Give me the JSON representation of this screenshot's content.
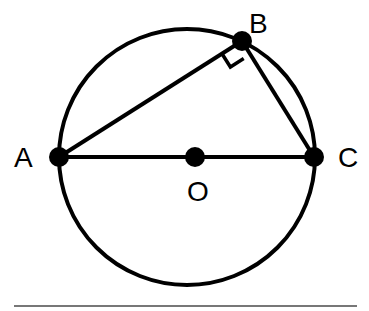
{
  "diagram": {
    "points": {
      "A": {
        "label": "A"
      },
      "B": {
        "label": "B"
      },
      "C": {
        "label": "C"
      },
      "O": {
        "label": "O"
      }
    },
    "segments": [
      "AB",
      "BC",
      "AC"
    ],
    "right_angle_at": "B",
    "center": "O",
    "colors": {
      "stroke": "#000000",
      "rule": "#777777",
      "background": "#ffffff"
    }
  }
}
